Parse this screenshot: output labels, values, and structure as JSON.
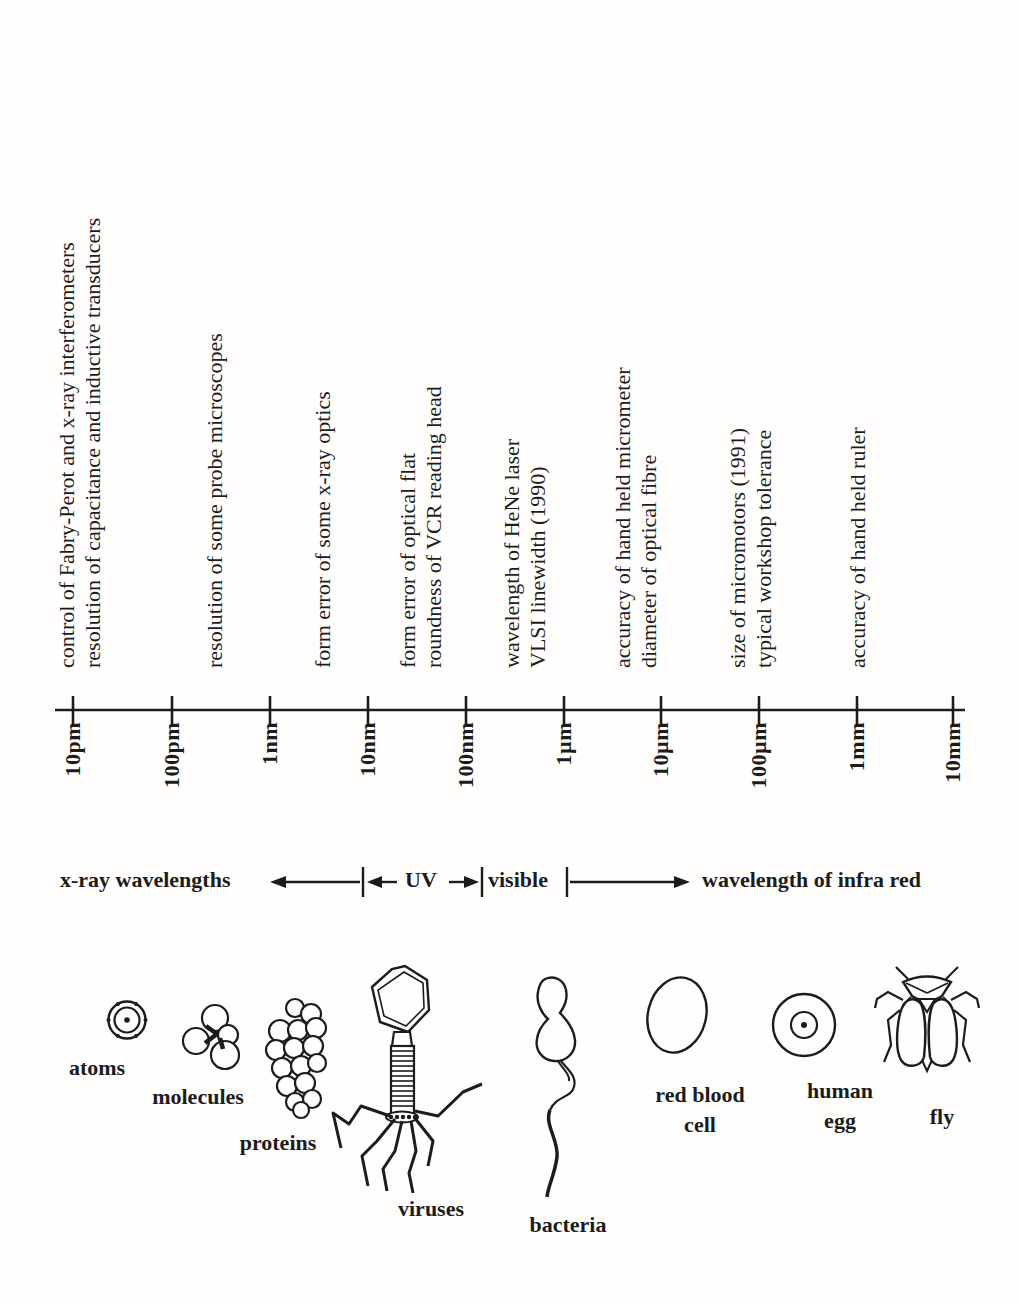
{
  "axis": {
    "tick_labels": [
      "10pm",
      "100pm",
      "1nm",
      "10nm",
      "100nm",
      "1µm",
      "10µm",
      "100µm",
      "1mm",
      "10mm"
    ]
  },
  "annotations": [
    {
      "lines": [
        "control of Fabry-Perot and x-ray interferometers",
        "resolution of capacitance and inductive transducers"
      ]
    },
    {
      "lines": [
        "resolution of some probe microscopes"
      ]
    },
    {
      "lines": [
        "form error of some x-ray optics"
      ]
    },
    {
      "lines": [
        "form error of optical flat",
        "roundness of VCR reading head"
      ]
    },
    {
      "lines": [
        "wavelength of HeNe laser",
        "VLSI linewidth (1990)"
      ]
    },
    {
      "lines": [
        "accuracy of hand held micrometer",
        "diameter of optical fibre"
      ]
    },
    {
      "lines": [
        "size of micromotors (1991)",
        "typical workshop tolerance"
      ]
    },
    {
      "lines": [
        "accuracy of hand held ruler"
      ]
    }
  ],
  "spectrum": {
    "xray_label": "x-ray wavelengths",
    "uv_label": "UV",
    "visible_label": "visible",
    "infrared_label": "wavelength of infra red"
  },
  "specimens": {
    "atoms": "atoms",
    "molecules": "molecules",
    "proteins": "proteins",
    "viruses": "viruses",
    "bacteria": "bacteria",
    "red_blood_cell": [
      "red blood",
      "cell"
    ],
    "human_egg": [
      "human",
      "egg"
    ],
    "fly": "fly"
  },
  "colors": {
    "ink": "#1c1c1c",
    "background": "#fffefd"
  }
}
